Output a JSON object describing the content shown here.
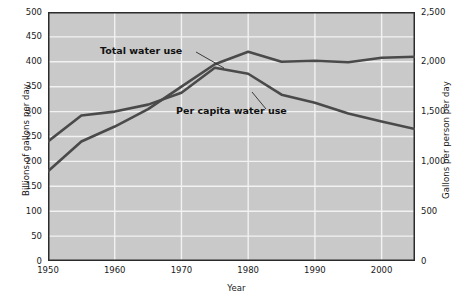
{
  "chart_data": {
    "type": "line",
    "title": "",
    "xlabel": "Year",
    "ylabel": "Billions of gallons per day",
    "ylabel_right": "Gallons per person per day",
    "xlim": [
      1950,
      2005
    ],
    "ylim": [
      0,
      500
    ],
    "ylim_right": [
      0,
      2500
    ],
    "grid": true,
    "legend_position": "inline-annotations",
    "xticks": [
      "1950",
      "1960",
      "1970",
      "1980",
      "1990",
      "2000"
    ],
    "xtick_values": [
      1950,
      1960,
      1970,
      1980,
      1990,
      2000
    ],
    "yticks_left": [
      "0",
      "50",
      "100",
      "150",
      "200",
      "250",
      "300",
      "350",
      "400",
      "450",
      "500"
    ],
    "ytick_values_left": [
      0,
      50,
      100,
      150,
      200,
      250,
      300,
      350,
      400,
      450,
      500
    ],
    "yticks_right": [
      "0",
      "500",
      "1,000",
      "1,500",
      "2,000",
      "2,500"
    ],
    "ytick_values_right": [
      0,
      500,
      1000,
      1500,
      2000,
      2500
    ],
    "series": [
      {
        "name": "Total water use",
        "axis": "left",
        "units": "billions of gallons per day",
        "color": "#4a4a4a",
        "label_text": "Total water use",
        "x": [
          1950,
          1955,
          1960,
          1965,
          1970,
          1975,
          1980,
          1985,
          1990,
          1995,
          2000,
          2005
        ],
        "values": [
          180,
          240,
          270,
          305,
          350,
          395,
          420,
          400,
          402,
          399,
          408,
          410
        ]
      },
      {
        "name": "Per capita water use",
        "axis": "right",
        "units": "gallons per person per day",
        "color": "#4a4a4a",
        "label_text": "Per capita water use",
        "x": [
          1950,
          1955,
          1960,
          1965,
          1970,
          1975,
          1980,
          1985,
          1990,
          1995,
          2000,
          2005
        ],
        "values": [
          1200,
          1460,
          1500,
          1570,
          1690,
          1940,
          1880,
          1670,
          1590,
          1480,
          1400,
          1325
        ],
        "values_on_left_scale": [
          240,
          292,
          300,
          314,
          338,
          388,
          376,
          334,
          318,
          296,
          280,
          265
        ]
      }
    ],
    "annotations": [
      {
        "text": "Total water use",
        "target_series": "Total water use",
        "leader_line": true
      },
      {
        "text": "Per capita water use",
        "target_series": "Per capita water use",
        "leader_line": true
      }
    ]
  },
  "axes": {
    "left_title": "Billions of gallons per day",
    "right_title": "Gallons per person per day",
    "x_title": "Year"
  }
}
